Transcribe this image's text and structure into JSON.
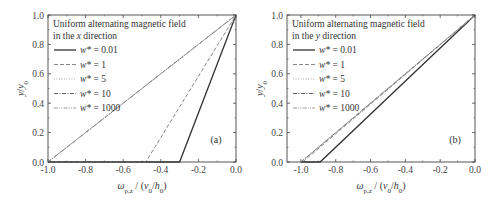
{
  "chart_data": [
    {
      "type": "line",
      "panel_label": "(a)",
      "legend_title_line1": "Uniform alternating magnetic field",
      "legend_title_line2_prefix": "in the ",
      "legend_title_line2_axis": "x",
      "legend_title_line2_suffix": " direction",
      "xlabel": "ω_p,z / (v0/h0)",
      "ylabel": "y/y0",
      "xlim": [
        -1.0,
        0.0
      ],
      "ylim": [
        0.0,
        1.0
      ],
      "xticks": [
        "-1.0",
        "-0.8",
        "-0.6",
        "-0.4",
        "-0.2",
        "0.0"
      ],
      "yticks": [
        "0.0",
        "0.2",
        "0.4",
        "0.6",
        "0.8",
        "1.0"
      ],
      "grid": false,
      "legend_position": "upper left",
      "series": [
        {
          "name": "w* = 0.01",
          "style": "solid",
          "x": [
            -1.0,
            -0.3,
            0.0
          ],
          "y": [
            0.0,
            0.0,
            1.0
          ]
        },
        {
          "name": "w* = 1",
          "style": "dashed",
          "x": [
            -1.0,
            -0.48,
            0.0
          ],
          "y": [
            0.0,
            0.0,
            1.0
          ]
        },
        {
          "name": "w* = 5",
          "style": "dotted",
          "x": [
            -1.0,
            0.0
          ],
          "y": [
            0.0,
            1.0
          ]
        },
        {
          "name": "w* = 10",
          "style": "dashdot",
          "x": [
            -1.0,
            0.0
          ],
          "y": [
            0.0,
            1.0
          ]
        },
        {
          "name": "w* = 1000",
          "style": "dashdotdot",
          "x": [
            -1.0,
            0.0
          ],
          "y": [
            0.0,
            1.0
          ]
        }
      ]
    },
    {
      "type": "line",
      "panel_label": "(b)",
      "legend_title_line1": "Uniform alternating magnetic field",
      "legend_title_line2_prefix": "in the ",
      "legend_title_line2_axis": "y",
      "legend_title_line2_suffix": " direction",
      "xlabel": "ω_p,z / (v0/h0)",
      "ylabel": "y/y0",
      "xlim": [
        -1.08,
        0.0
      ],
      "ylim": [
        0.0,
        1.0
      ],
      "xticks": [
        "-1.0",
        "-0.8",
        "-0.6",
        "-0.4",
        "-0.2",
        "0.0"
      ],
      "yticks": [
        "0.0",
        "0.2",
        "0.4",
        "0.6",
        "0.8",
        "1.0"
      ],
      "grid": false,
      "legend_position": "upper left",
      "series": [
        {
          "name": "w* = 0.01",
          "style": "solid",
          "x": [
            -1.0,
            -0.89,
            0.0
          ],
          "y": [
            0.0,
            0.0,
            1.0
          ]
        },
        {
          "name": "w* = 1",
          "style": "dashed",
          "x": [
            -0.99,
            0.0
          ],
          "y": [
            0.0,
            1.0
          ]
        },
        {
          "name": "w* = 5",
          "style": "dotted",
          "x": [
            -1.0,
            0.0
          ],
          "y": [
            0.0,
            1.0
          ]
        },
        {
          "name": "w* = 10",
          "style": "dashdot",
          "x": [
            -1.0,
            0.0
          ],
          "y": [
            0.0,
            1.0
          ]
        },
        {
          "name": "w* = 1000",
          "style": "dashdotdot",
          "x": [
            -1.0,
            0.0
          ],
          "y": [
            0.0,
            1.0
          ]
        }
      ]
    }
  ],
  "colors": {
    "axis": "#444444",
    "solid": "#333333",
    "dashed": "#888888",
    "dotted": "#aaaaaa",
    "dashdot": "#666666",
    "dashdotdot": "#999999"
  }
}
